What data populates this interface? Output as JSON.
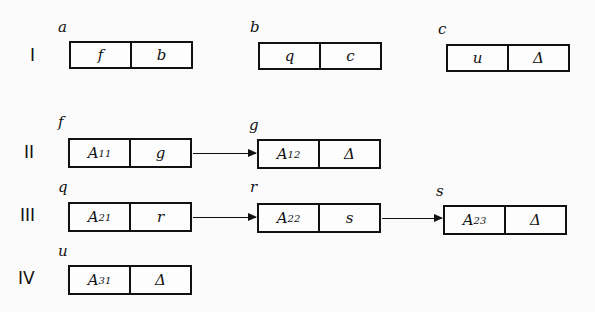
{
  "rows": [
    {
      "label": "I"
    },
    {
      "label": "II"
    },
    {
      "label": "III"
    },
    {
      "label": "IV"
    }
  ],
  "nodes": {
    "a": {
      "name": "a",
      "left": "f",
      "right": "b"
    },
    "b": {
      "name": "b",
      "left": "q",
      "right": "c"
    },
    "c": {
      "name": "c",
      "left": "u",
      "right": "Δ"
    },
    "f": {
      "name": "f",
      "left": "A",
      "left_sub": "11",
      "right": "g"
    },
    "g": {
      "name": "g",
      "left": "A",
      "left_sub": "12",
      "right": "Δ"
    },
    "q": {
      "name": "q",
      "left": "A",
      "left_sub": "21",
      "right": "r"
    },
    "r": {
      "name": "r",
      "left": "A",
      "left_sub": "22",
      "right": "s"
    },
    "s": {
      "name": "s",
      "left": "A",
      "left_sub": "23",
      "right": "Δ"
    },
    "u": {
      "name": "u",
      "left": "A",
      "left_sub": "31",
      "right": "Δ"
    }
  },
  "edges": [
    {
      "from": "f",
      "to": "g"
    },
    {
      "from": "q",
      "to": "r"
    },
    {
      "from": "r",
      "to": "s"
    }
  ]
}
